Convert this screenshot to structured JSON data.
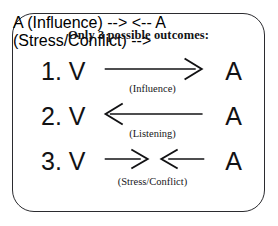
{
  "figure": {
    "title": "Only 3 possible outcomes:",
    "border_color": "#2b2b2f",
    "text_color": "#121214",
    "background": "#ffffff"
  },
  "rows": [
    {
      "index": "1.",
      "left_node": "V",
      "right_node": "A",
      "left_text": "1. V",
      "label": "(Influence)",
      "arrow": "right",
      "direction_desc": "arrow-right-icon"
    },
    {
      "index": "2.",
      "left_node": "V",
      "right_node": "A",
      "left_text": "2. V",
      "label": "(Listening)",
      "arrow": "left",
      "direction_desc": "arrow-left-icon"
    },
    {
      "index": "3.",
      "left_node": "V",
      "right_node": "A",
      "left_text": "3. V",
      "label": "(Stress/Conflict)",
      "arrow": "both-inward",
      "direction_desc": "arrows-converging-icon"
    }
  ]
}
